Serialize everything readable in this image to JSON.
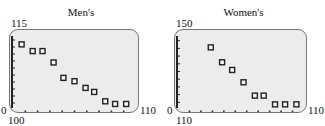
{
  "chart_data": [
    {
      "type": "scatter",
      "title": "Men's",
      "xlabel": "",
      "ylabel": "",
      "x_min_label": "100",
      "x_max_label": "110",
      "y_min_label": "0",
      "y_max_label": "115",
      "xlim": [
        100,
        110
      ],
      "ylim": [
        0,
        115
      ],
      "grid": false,
      "x_ticks": 10,
      "y_ticks": 11,
      "x": [
        100.7,
        101.6,
        102.4,
        103.3,
        104.1,
        105.0,
        105.9,
        106.6,
        107.5,
        108.3,
        109.2
      ],
      "y": [
        98,
        88,
        88,
        71,
        48,
        43,
        33,
        27,
        13,
        9,
        9
      ]
    },
    {
      "type": "scatter",
      "title": "Women's",
      "xlabel": "",
      "ylabel": "",
      "x_min_label": "110",
      "x_max_label": "110",
      "y_min_label": "0",
      "y_max_label": "150",
      "xlim": [
        0,
        10
      ],
      "ylim": [
        0,
        150
      ],
      "grid": false,
      "x_ticks": 11,
      "y_ticks": 10,
      "x": [
        2.6,
        3.5,
        4.3,
        5.2,
        6.1,
        6.8,
        7.7,
        8.5,
        9.4
      ],
      "y": [
        122,
        93,
        78,
        54,
        28,
        28,
        11,
        11,
        11
      ]
    }
  ],
  "colors": {
    "plot_bg": "#ececec",
    "frame": "#777777",
    "marker": "#222222"
  }
}
